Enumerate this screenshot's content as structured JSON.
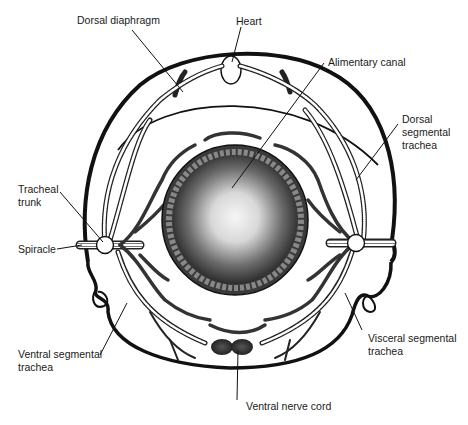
{
  "diagram": {
    "type": "anatomical cross-section",
    "colors": {
      "ink": "#111111",
      "background": "#ffffff",
      "gut_center": "#f4f4f4",
      "gut_edge": "#2a2a2a"
    },
    "labels": {
      "dorsal_diaphragm": "Dorsal diaphragm",
      "heart": "Heart",
      "alimentary_canal": "Alimentary canal",
      "dorsal_segmental_trachea": [
        "Dorsal",
        "segmental",
        "trachea"
      ],
      "tracheal_trunk": [
        "Tracheal",
        "trunk"
      ],
      "spiracle": "Spiracle",
      "ventral_segmental_trachea": [
        "Ventral segmental",
        "trachea"
      ],
      "visceral_segmental_trachea": [
        "Visceral segmental",
        "trachea"
      ],
      "ventral_nerve_cord": "Ventral nerve cord"
    }
  }
}
